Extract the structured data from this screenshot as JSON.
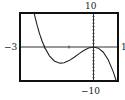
{
  "chart_data": {
    "type": "line",
    "title": "",
    "xlabel": "",
    "ylabel": "",
    "xlim": [
      -3,
      1
    ],
    "ylim": [
      -10,
      10
    ],
    "x_tick_step": 1,
    "y_tick_step": 1,
    "grid": false,
    "labels": {
      "xmin": "−3",
      "xmax": "1",
      "ymax": "10",
      "ymin": "−10"
    },
    "series": [
      {
        "name": "f(x)",
        "x": [
          -2.42,
          -2.4,
          -2.3,
          -2.2,
          -2.1,
          -2.0,
          -1.8,
          -1.6,
          -1.4,
          -1.33,
          -1.2,
          -1.0,
          -0.8,
          -0.6,
          -0.4,
          -0.2,
          0.0,
          0.2,
          0.4,
          0.6,
          0.8,
          0.93
        ],
        "y": [
          10,
          9.22,
          6.35,
          3.87,
          1.76,
          0,
          -2.59,
          -4.1,
          -4.7,
          -4.74,
          -4.61,
          -4.0,
          -3.07,
          -2.02,
          -1.02,
          -0.29,
          0,
          -0.35,
          -1.54,
          -3.74,
          -7.17,
          -10
        ]
      }
    ]
  },
  "colors": {
    "frame": "#111111",
    "axis": "#333333",
    "curve": "#222222",
    "background": "#ffffff"
  }
}
